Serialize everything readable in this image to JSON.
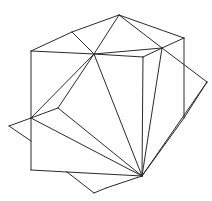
{
  "figure": {
    "stroke_color": "#2a2a2a",
    "background": "#ffffff",
    "vertices": {
      "A": [
        119,
        15
      ],
      "B": [
        72,
        32
      ],
      "C": [
        31,
        51
      ],
      "D": [
        94,
        54
      ],
      "F": [
        162,
        48
      ],
      "G": [
        184,
        38
      ],
      "H": [
        143,
        57
      ],
      "I": [
        207,
        82
      ],
      "J": [
        184,
        118
      ],
      "K": [
        142,
        176
      ],
      "L": [
        9,
        126
      ],
      "M": [
        31,
        118
      ],
      "N": [
        58,
        108
      ],
      "S": [
        31,
        141
      ],
      "O": [
        31,
        170
      ],
      "P": [
        67,
        172
      ],
      "Q": [
        94,
        193
      ],
      "R": [
        106,
        188
      ]
    },
    "edges": [
      [
        "C",
        "B"
      ],
      [
        "B",
        "A"
      ],
      [
        "A",
        "G"
      ],
      [
        "B",
        "D"
      ],
      [
        "A",
        "D"
      ],
      [
        "C",
        "D"
      ],
      [
        "D",
        "F"
      ],
      [
        "A",
        "F"
      ],
      [
        "F",
        "G"
      ],
      [
        "G",
        "J"
      ],
      [
        "F",
        "I"
      ],
      [
        "I",
        "J"
      ],
      [
        "I",
        "K"
      ],
      [
        "F",
        "K"
      ],
      [
        "D",
        "H"
      ],
      [
        "H",
        "F"
      ],
      [
        "H",
        "K"
      ],
      [
        "D",
        "K"
      ],
      [
        "D",
        "M"
      ],
      [
        "D",
        "N"
      ],
      [
        "N",
        "K"
      ],
      [
        "M",
        "K"
      ],
      [
        "M",
        "L"
      ],
      [
        "L",
        "S"
      ],
      [
        "C",
        "O"
      ],
      [
        "M",
        "N"
      ],
      [
        "O",
        "P"
      ],
      [
        "P",
        "K"
      ],
      [
        "P",
        "Q"
      ],
      [
        "Q",
        "R"
      ],
      [
        "R",
        "K"
      ],
      [
        "J",
        "K"
      ]
    ]
  }
}
